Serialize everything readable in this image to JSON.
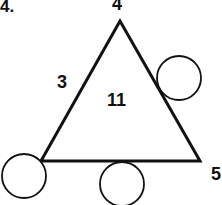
{
  "problem_number": "4.",
  "triangle": {
    "top_label": "4",
    "right_label": "5",
    "left_side_label": "3",
    "center_label": "11"
  },
  "blank_circles": [
    {
      "position": "right-side",
      "value": ""
    },
    {
      "position": "bottom-left-vertex",
      "value": ""
    },
    {
      "position": "bottom-side",
      "value": ""
    }
  ],
  "colors": {
    "stroke": "#111111",
    "background": "#ffffff"
  }
}
